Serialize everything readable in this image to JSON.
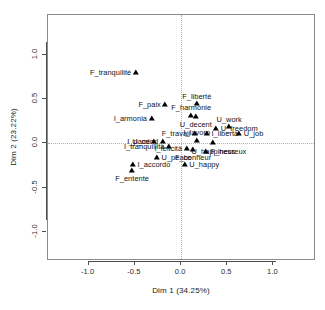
{
  "chart_data": {
    "type": "scatter",
    "title": "",
    "xlabel": "Dim 1 (34.25%)",
    "ylabel": "Dim 2 (23.22%)",
    "xlim": [
      -1.44,
      1.46
    ],
    "ylim": [
      -1.33,
      1.45
    ],
    "xticks": [
      "-1.0",
      "-0.5",
      "0.0",
      "0.5",
      "1.0"
    ],
    "xtickvalues": [
      -1.0,
      -0.5,
      0.0,
      0.5,
      1.0
    ],
    "yticks": [
      "1.0",
      "0.5",
      "0.0",
      "-0.5",
      "-1.0"
    ],
    "ytickvalues": [
      1.0,
      0.5,
      0.0,
      -0.5,
      -1.0
    ],
    "grid": "dotted reference lines at x=0 and y=0",
    "legend": "none",
    "marker": "filled-triangle",
    "points": [
      {
        "label": "F_tranquilité",
        "x": -0.49,
        "y": 0.8,
        "pos": "left"
      },
      {
        "label": "F_paix",
        "x": -0.17,
        "y": 0.43,
        "pos": "left"
      },
      {
        "label": "F_liberté",
        "x": 0.17,
        "y": 0.44,
        "pos": "above"
      },
      {
        "label": "F_harmonie",
        "x": 0.11,
        "y": 0.31,
        "pos": "above"
      },
      {
        "label": "I_armonia",
        "x": -0.32,
        "y": 0.27,
        "pos": "left"
      },
      {
        "label": "U_decent",
        "x": 0.16,
        "y": 0.3,
        "pos": "below"
      },
      {
        "label": "U_work",
        "x": 0.52,
        "y": 0.18,
        "pos": "above"
      },
      {
        "label": "U_freedom",
        "x": 0.38,
        "y": 0.16,
        "pos": "right"
      },
      {
        "label": "F_travail",
        "x": 0.15,
        "y": 0.11,
        "pos": "left"
      },
      {
        "label": "I_libertà",
        "x": 0.28,
        "y": 0.11,
        "pos": "right"
      },
      {
        "label": "U_job",
        "x": 0.63,
        "y": 0.1,
        "pos": "right"
      },
      {
        "label": "I_pace",
        "x": -0.29,
        "y": 0.02,
        "pos": "left"
      },
      {
        "label": "U_mind",
        "x": -0.2,
        "y": 0.01,
        "pos": "left"
      },
      {
        "label": "I_lavoro",
        "x": 0.17,
        "y": 0.03,
        "pos": "above"
      },
      {
        "label": "U_happiness",
        "x": 0.35,
        "y": 0.0,
        "pos": "below"
      },
      {
        "label": "I_tranquillità",
        "x": -0.13,
        "y": -0.04,
        "pos": "left"
      },
      {
        "label": "I_felicità",
        "x": 0.06,
        "y": -0.06,
        "pos": "left"
      },
      {
        "label": "F_bonheur",
        "x": 0.13,
        "y": -0.07,
        "pos": "below"
      },
      {
        "label": "F_heureux",
        "x": 0.27,
        "y": -0.1,
        "pos": "right"
      },
      {
        "label": "U_peace",
        "x": -0.26,
        "y": -0.17,
        "pos": "right"
      },
      {
        "label": "I_accordo",
        "x": -0.52,
        "y": -0.25,
        "pos": "right"
      },
      {
        "label": "U_happy",
        "x": 0.04,
        "y": -0.25,
        "pos": "right"
      },
      {
        "label": "F_entente",
        "x": -0.53,
        "y": -0.31,
        "pos": "below"
      }
    ]
  },
  "axes": {
    "x_title": "Dim 1 (34.25%)",
    "y_title": "Dim 2 (23.22%)"
  }
}
